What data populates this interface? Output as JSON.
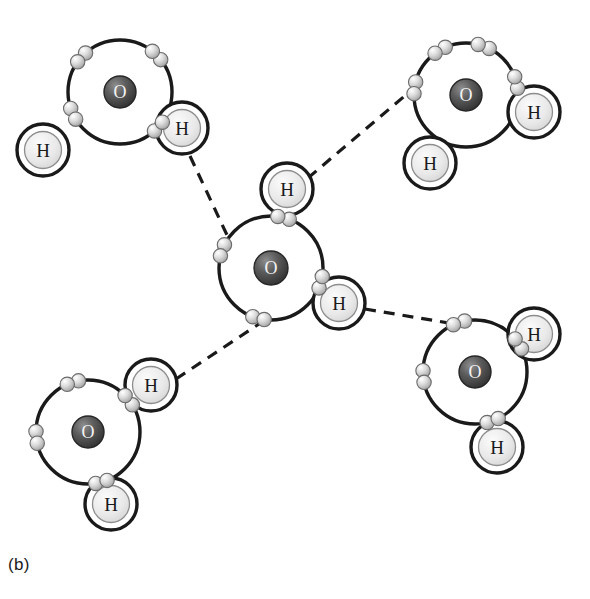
{
  "figure": {
    "label": "(b)",
    "background_color": "#ffffff",
    "line_color": "#1a1a1a",
    "oxygen_label": "O",
    "hydrogen_label": "H",
    "oxygen_color": "#4a4a4a",
    "hydrogen_color": "#e8e8e8",
    "electron_color": "#cfcfcf",
    "bond_style": "dashed"
  },
  "diagram": {
    "type": "molecular-diagram",
    "molecule_formula": "H2O",
    "molecule_count": 5,
    "hydrogen_bond_count": 4,
    "shell_radius": 52,
    "molecules": [
      {
        "id": "molecule-top-left",
        "position": "top-left",
        "oxygen": {
          "cx": 120,
          "cy": 92,
          "r": 16,
          "label": "O"
        },
        "shell": {
          "cx": 120,
          "cy": 92,
          "r": 52
        },
        "hydrogens": [
          {
            "id": "h-top-left-lower",
            "cx": 43,
            "cy": 150,
            "r": 26,
            "label": "H"
          },
          {
            "id": "h-top-left-right",
            "cx": 182,
            "cy": 128,
            "r": 26,
            "label": "H"
          }
        ],
        "bonding_pairs": [
          {
            "angle": 138,
            "spread": 13
          },
          {
            "angle": 45,
            "spread": 13
          }
        ],
        "lone_pairs": [
          {
            "angle": 205,
            "spread": 13
          },
          {
            "angle": 318,
            "spread": 13
          }
        ]
      },
      {
        "id": "molecule-top-right",
        "position": "top-right",
        "oxygen": {
          "cx": 466,
          "cy": 95,
          "r": 16,
          "label": "O"
        },
        "shell": {
          "cx": 466,
          "cy": 95,
          "r": 52
        },
        "hydrogens": [
          {
            "id": "h-top-right-lower",
            "cx": 430,
            "cy": 163,
            "r": 26,
            "label": "H"
          },
          {
            "id": "h-top-right-right",
            "cx": 534,
            "cy": 112,
            "r": 26,
            "label": "H"
          }
        ],
        "bonding_pairs": [
          {
            "angle": 120,
            "spread": 13
          },
          {
            "angle": 14,
            "spread": 13
          }
        ],
        "lone_pairs": [
          {
            "angle": 70,
            "spread": 13
          },
          {
            "angle": 172,
            "spread": 13
          }
        ]
      },
      {
        "id": "molecule-center",
        "position": "center",
        "oxygen": {
          "cx": 271,
          "cy": 268,
          "r": 17,
          "label": "O"
        },
        "shell": {
          "cx": 271,
          "cy": 268,
          "r": 52
        },
        "hydrogens": [
          {
            "id": "h-center-top",
            "cx": 287,
            "cy": 189,
            "r": 26,
            "label": "H"
          },
          {
            "id": "h-center-right",
            "cx": 339,
            "cy": 303,
            "r": 26,
            "label": "H"
          }
        ],
        "bonding_pairs": [
          {
            "angle": 76,
            "spread": 13
          },
          {
            "angle": 344,
            "spread": 13
          }
        ],
        "lone_pairs": [
          {
            "angle": 160,
            "spread": 13
          },
          {
            "angle": 256,
            "spread": 13
          }
        ]
      },
      {
        "id": "molecule-bottom-left",
        "position": "bottom-left",
        "oxygen": {
          "cx": 88,
          "cy": 432,
          "r": 16,
          "label": "O"
        },
        "shell": {
          "cx": 88,
          "cy": 432,
          "r": 52
        },
        "hydrogens": [
          {
            "id": "h-bottom-left-upper",
            "cx": 151,
            "cy": 385,
            "r": 26,
            "label": "H"
          },
          {
            "id": "h-bottom-left-lower",
            "cx": 111,
            "cy": 504,
            "r": 26,
            "label": "H"
          }
        ],
        "bonding_pairs": [
          {
            "angle": 38,
            "spread": 13
          },
          {
            "angle": 285,
            "spread": 13
          }
        ],
        "lone_pairs": [
          {
            "angle": 107,
            "spread": 13
          },
          {
            "angle": 186,
            "spread": 13
          }
        ]
      },
      {
        "id": "molecule-bottom-right",
        "position": "bottom-right",
        "oxygen": {
          "cx": 475,
          "cy": 372,
          "r": 16,
          "label": "O"
        },
        "shell": {
          "cx": 475,
          "cy": 372,
          "r": 52
        },
        "hydrogens": [
          {
            "id": "h-bottom-right-upper",
            "cx": 534,
            "cy": 334,
            "r": 26,
            "label": "H"
          },
          {
            "id": "h-bottom-right-lower",
            "cx": 497,
            "cy": 447,
            "r": 26,
            "label": "H"
          }
        ],
        "bonding_pairs": [
          {
            "angle": 33,
            "spread": 13
          },
          {
            "angle": 290,
            "spread": 13
          }
        ],
        "lone_pairs": [
          {
            "angle": 108,
            "spread": 13
          },
          {
            "angle": 185,
            "spread": 13
          }
        ]
      }
    ],
    "hydrogen_bonds": [
      {
        "id": "hbond-topleft-to-center",
        "x1": 190,
        "y1": 156,
        "x2": 234,
        "y2": 250
      },
      {
        "id": "hbond-center-to-topright",
        "x1": 308,
        "y1": 178,
        "x2": 414,
        "y2": 88
      },
      {
        "id": "hbond-center-to-bottomright",
        "x1": 365,
        "y1": 309,
        "x2": 455,
        "y2": 324
      },
      {
        "id": "hbond-bottomleft-to-center",
        "x1": 176,
        "y1": 379,
        "x2": 262,
        "y2": 322
      }
    ]
  }
}
